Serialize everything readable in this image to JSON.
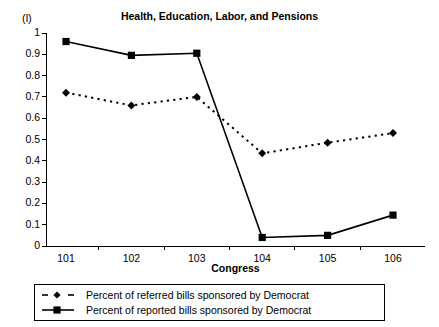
{
  "chart_data": {
    "type": "line",
    "title": "Health, Education, Labor, and Pensions",
    "corner_label": "(l)",
    "xlabel": "Congress",
    "ylabel": "",
    "categories": [
      "101",
      "102",
      "103",
      "104",
      "105",
      "106"
    ],
    "x": [
      101,
      102,
      103,
      104,
      105,
      106
    ],
    "xlim": [
      100.7,
      106.5
    ],
    "ylim": [
      0,
      1
    ],
    "ytick_labels": [
      "0",
      "0.1",
      "0.2",
      "0.3",
      "0.4",
      "0.5",
      "0.6",
      "0.7",
      "0.8",
      "0.9",
      "1"
    ],
    "ytick_values": [
      0,
      0.1,
      0.2,
      0.3,
      0.4,
      0.5,
      0.6,
      0.7,
      0.8,
      0.9,
      1
    ],
    "grid": false,
    "legend_position": "below-axes",
    "series": [
      {
        "name": "Percent of referred bills sponsored by Democrat",
        "marker": "diamond",
        "line_style": "dotted",
        "color": "#000000",
        "values": [
          0.72,
          0.66,
          0.7,
          0.435,
          0.485,
          0.53
        ]
      },
      {
        "name": "Percent of reported bills sponsored by Democrat",
        "marker": "square",
        "line_style": "solid",
        "color": "#000000",
        "values": [
          0.96,
          0.895,
          0.905,
          0.04,
          0.05,
          0.145
        ]
      }
    ]
  }
}
